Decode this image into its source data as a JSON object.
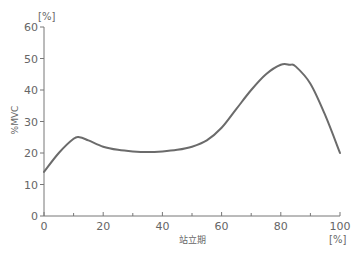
{
  "chart_data": {
    "type": "line",
    "title": "",
    "xlabel": "站立期",
    "ylabel": "%MVC",
    "x_unit": "[%]",
    "y_unit": "[%]",
    "xlim": [
      0,
      100
    ],
    "ylim": [
      0,
      60
    ],
    "x_ticks": [
      0,
      20,
      40,
      60,
      80,
      100
    ],
    "x_minor_ticks": [
      10,
      30,
      50,
      70,
      90
    ],
    "y_ticks": [
      0,
      10,
      20,
      30,
      40,
      50,
      60
    ],
    "grid": false,
    "legend": null,
    "series": [
      {
        "name": "%MVC",
        "color": "#6b6b6b",
        "x": [
          0,
          5,
          10,
          12,
          15,
          20,
          25,
          30,
          35,
          40,
          45,
          50,
          55,
          60,
          65,
          70,
          75,
          80,
          83,
          85,
          90,
          95,
          100
        ],
        "y": [
          14,
          20,
          24.5,
          25,
          24,
          22,
          21,
          20.5,
          20.3,
          20.5,
          21,
          22,
          24,
          28,
          34,
          40,
          45,
          48,
          48,
          47.5,
          42,
          32,
          20
        ]
      }
    ]
  },
  "header": {
    "cropped_title": ""
  }
}
